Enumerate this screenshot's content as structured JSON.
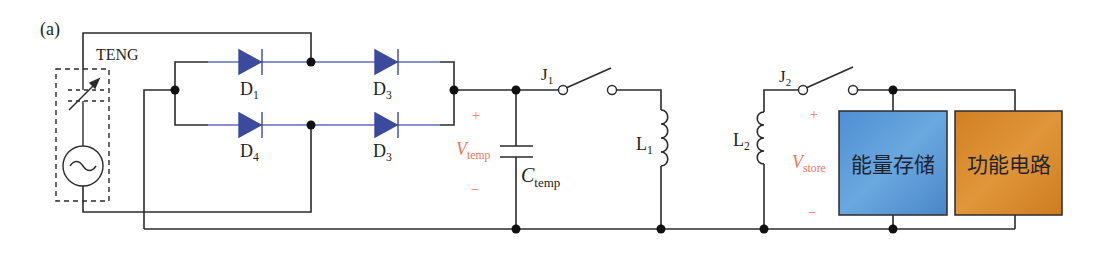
{
  "figure": {
    "panel_label": "(a)",
    "source": {
      "label": "TENG"
    },
    "diodes": [
      {
        "id": "D1",
        "base": "D",
        "sub": "1",
        "position": "upper-left"
      },
      {
        "id": "D3a",
        "base": "D",
        "sub": "3",
        "position": "upper-right"
      },
      {
        "id": "D4",
        "base": "D",
        "sub": "4",
        "position": "lower-left"
      },
      {
        "id": "D3b",
        "base": "D",
        "sub": "3",
        "position": "lower-right"
      }
    ],
    "v_temp": {
      "base": "V",
      "sub": "temp",
      "plus": "+",
      "minus": "−"
    },
    "c_temp": {
      "base": "C",
      "sub": "temp"
    },
    "switch_1": {
      "base": "J",
      "sub": "1"
    },
    "switch_2": {
      "base": "J",
      "sub": "2"
    },
    "inductor_1": {
      "base": "L",
      "sub": "1"
    },
    "inductor_2": {
      "base": "L",
      "sub": "2"
    },
    "v_store": {
      "base": "V",
      "sub": "store",
      "plus": "+",
      "minus": "−"
    },
    "blocks": [
      {
        "label": "能量存储",
        "color": "#5b9bd8"
      },
      {
        "label": "功能电路",
        "color": "#d98a2c"
      }
    ],
    "colors": {
      "wire": "#2b2b2b",
      "diode": "#3b4a9c",
      "diode_wire": "#5f6fb8",
      "annotation": "#e9785a"
    }
  }
}
